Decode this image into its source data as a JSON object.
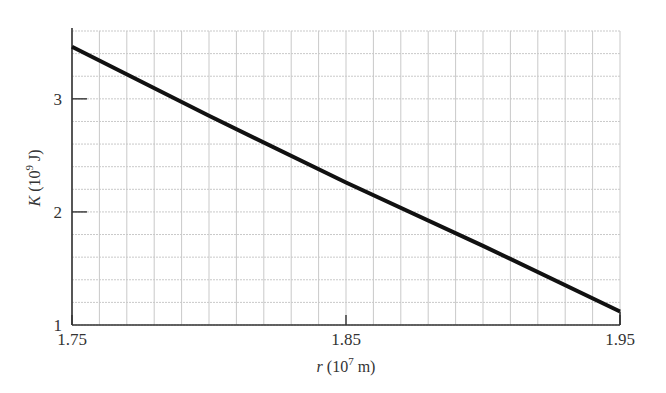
{
  "chart_data": {
    "type": "line",
    "title": "",
    "xlabel": "r (10^7 m)",
    "ylabel": "K (10^9 J)",
    "xlim": [
      1.75,
      1.95
    ],
    "ylim": [
      1,
      3.6
    ],
    "x_ticks": [
      "1.75",
      "1.85",
      "1.95"
    ],
    "y_ticks": [
      "1",
      "2",
      "3"
    ],
    "grid": true,
    "grid_x_step": 0.01,
    "grid_y_step": 0.2,
    "legend": null,
    "series": [
      {
        "name": "K",
        "x": [
          1.75,
          1.8,
          1.85,
          1.9,
          1.95
        ],
        "values": [
          3.46,
          2.85,
          2.26,
          1.7,
          1.12
        ]
      }
    ]
  },
  "labels": {
    "x_axis_var": "r",
    "x_axis_unit_base": "(10",
    "x_axis_unit_exp": "7",
    "x_axis_unit_rest": " m)",
    "y_axis_var": "K",
    "y_axis_unit_base": "(10",
    "y_axis_unit_exp": "9",
    "y_axis_unit_rest": " J)"
  }
}
